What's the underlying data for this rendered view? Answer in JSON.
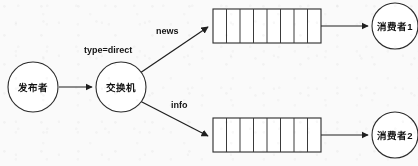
{
  "diagram": {
    "background_color": "#fafafa",
    "stroke_color": "#2b2b2b",
    "text_color": "#111111",
    "nodes": {
      "publisher": {
        "label": "发布者",
        "shape": "circle",
        "cx": 33,
        "cy": 87,
        "r": 25
      },
      "exchange": {
        "label": "交换机",
        "shape": "circle",
        "cx": 121,
        "cy": 87,
        "r": 25
      },
      "consumer1": {
        "label": "消费者1",
        "shape": "circle",
        "cx": 395,
        "cy": 26,
        "r": 23
      },
      "consumer2": {
        "label": "消费者2",
        "shape": "circle",
        "cx": 395,
        "cy": 135,
        "r": 23
      }
    },
    "queues": [
      {
        "name": "queue-news",
        "x": 213,
        "y": 9,
        "width": 108,
        "height": 34,
        "cells": 8
      },
      {
        "name": "queue-info",
        "x": 213,
        "y": 118,
        "width": 108,
        "height": 34,
        "cells": 8
      }
    ],
    "edges": [
      {
        "name": "publisher-to-exchange",
        "label": ""
      },
      {
        "name": "exchange-to-queue-news",
        "label": "news",
        "label_x": 156,
        "label_y": 32
      },
      {
        "name": "exchange-to-queue-info",
        "label": "info",
        "label_x": 171,
        "label_y": 106
      },
      {
        "name": "queue-news-to-consumer1",
        "label": ""
      },
      {
        "name": "queue-info-to-consumer2",
        "label": ""
      }
    ],
    "annotations": [
      {
        "name": "exchange-type-annotation",
        "text": "type=direct",
        "x": 84,
        "y": 51
      }
    ]
  }
}
